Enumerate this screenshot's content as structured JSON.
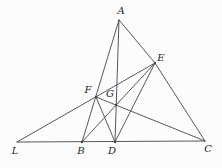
{
  "figure": {
    "width": 222,
    "height": 168,
    "background": "#fcfcfc",
    "stroke_color": "#454545",
    "label_color": "#1e1e1e",
    "stroke_width": 0.9,
    "points": {
      "A": {
        "label": "A",
        "x": 119,
        "y": 20,
        "lx": 121,
        "ly": 14
      },
      "E": {
        "label": "E",
        "x": 155,
        "y": 63,
        "lx": 161,
        "ly": 61
      },
      "F": {
        "label": "F",
        "x": 96,
        "y": 97,
        "lx": 88,
        "ly": 93
      },
      "G": {
        "label": "G",
        "x": 116,
        "y": 105,
        "lx": 110,
        "ly": 97
      },
      "L": {
        "label": "L",
        "x": 17,
        "y": 142,
        "lx": 15,
        "ly": 154
      },
      "B": {
        "label": "B",
        "x": 82,
        "y": 142,
        "lx": 81,
        "ly": 154
      },
      "D": {
        "label": "D",
        "x": 115,
        "y": 142,
        "lx": 112,
        "ly": 154
      },
      "C": {
        "label": "C",
        "x": 205,
        "y": 141,
        "lx": 208,
        "ly": 152
      }
    },
    "edges": [
      [
        "L",
        "C"
      ],
      [
        "A",
        "B"
      ],
      [
        "A",
        "D"
      ],
      [
        "A",
        "E"
      ],
      [
        "E",
        "C"
      ],
      [
        "L",
        "E"
      ],
      [
        "B",
        "E"
      ],
      [
        "D",
        "E"
      ],
      [
        "D",
        "F"
      ],
      [
        "F",
        "C"
      ]
    ],
    "dots": [
      "B",
      "D",
      "E",
      "F",
      "G"
    ]
  }
}
